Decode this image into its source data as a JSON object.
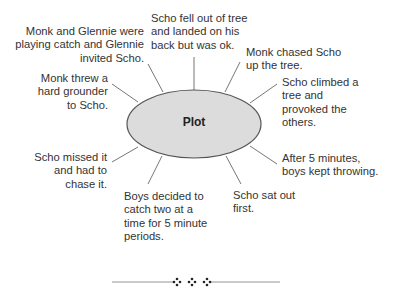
{
  "diagram": {
    "center": "Plot",
    "events": [
      {
        "id": "top_left",
        "text": "Monk and Glennie were\nplaying catch and Glennie\ninvited Scho."
      },
      {
        "id": "top",
        "text": "Scho fell out of tree\nand landed on his\nback but was ok."
      },
      {
        "id": "top_right",
        "text": "Monk chased Scho\nup the tree."
      },
      {
        "id": "right_upper",
        "text": "Scho climbed a\ntree and\nprovoked the\nothers."
      },
      {
        "id": "left_upper",
        "text": "Monk threw a\nhard grounder\nto Scho."
      },
      {
        "id": "left_lower",
        "text": "Scho missed it\nand had to\nchase it."
      },
      {
        "id": "bottom_left",
        "text": "Boys decided to\ncatch two at a\ntime for 5 minute\nperiods."
      },
      {
        "id": "bottom_right",
        "text": "Scho sat out\nfirst."
      },
      {
        "id": "right_lower",
        "text": "After 5 minutes,\nboys kept throwing."
      }
    ],
    "divider_ornament": "❖ ❖ ❖",
    "colors": {
      "ellipse_fill": "#dcdcdc",
      "ellipse_stroke": "#555555",
      "line": "#666666",
      "text": "#333333"
    }
  }
}
